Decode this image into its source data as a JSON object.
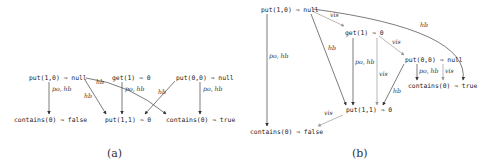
{
  "figure_a": {
    "caption": "(a)",
    "nodes": {
      "put10": "put(1,0) ⇒ null",
      "get1": "get(1) ⇒ 0",
      "put00": "put(0,0) ⇒ null",
      "contains_false": "contains(0) ⇒ false",
      "put11": "put(1,1) ⇒ 0",
      "contains_true": "contains(0) ⇒ true"
    },
    "edges": [
      {
        "from": "put10",
        "to": "contains_false",
        "label": "po, hb"
      },
      {
        "from": "put10",
        "to": "put11",
        "label": "hb"
      },
      {
        "from": "put10",
        "to": "contains_true",
        "label": "hb"
      },
      {
        "from": "get1",
        "to": "put11",
        "label": "po, hb"
      },
      {
        "from": "put00",
        "to": "put11",
        "label": "hb"
      },
      {
        "from": "put00",
        "to": "contains_true",
        "label": "po, hb"
      }
    ]
  },
  "figure_b": {
    "caption": "(b)",
    "nodes": {
      "put10": "put(1,0) ⇒ null",
      "get1": "get(1) ⇒ 0",
      "put00": "put(0,0) ⇒ null",
      "contains_true": "contains(0) ⇒ true",
      "put11": "put(1,1) ⇒ 0",
      "contains_false": "contains(0) ⇒ false"
    },
    "edges": [
      {
        "from": "put10",
        "to": "get1",
        "label": "vis"
      },
      {
        "from": "put10",
        "to": "contains_true",
        "label": "hb"
      },
      {
        "from": "put10",
        "to": "put11",
        "label": "hb"
      },
      {
        "from": "put10",
        "to": "contains_false",
        "label": "po, hb"
      },
      {
        "from": "get1",
        "to": "put00",
        "label": "vis"
      },
      {
        "from": "get1",
        "to": "put11",
        "label": "po, hb"
      },
      {
        "from": "get1",
        "to": "put11",
        "label": "vis"
      },
      {
        "from": "put00",
        "to": "contains_true",
        "label": "po, hb"
      },
      {
        "from": "put00",
        "to": "contains_true",
        "label": "vis"
      },
      {
        "from": "put00",
        "to": "put11",
        "label": "hb"
      },
      {
        "from": "put11",
        "to": "contains_false",
        "label": "vis"
      }
    ]
  }
}
